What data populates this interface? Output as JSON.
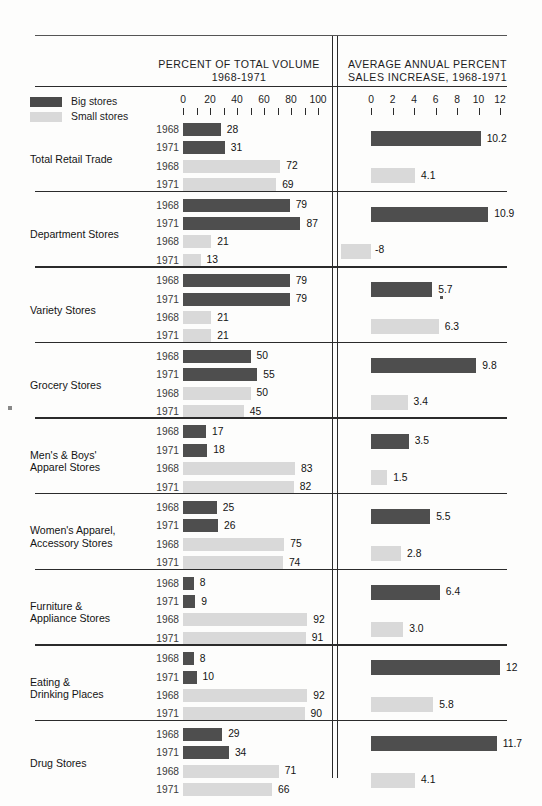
{
  "figure": {
    "left_header": "PERCENT OF TOTAL VOLUME\n1968-1971",
    "left_header_l1": "PERCENT OF TOTAL VOLUME",
    "left_header_l2": "1968-1971",
    "right_header_l1": "AVERAGE ANNUAL PERCENT",
    "right_header_l2": "SALES INCREASE, 1968-1971"
  },
  "legend": {
    "items": [
      {
        "label": "Big stores",
        "color": "#4a4a4a",
        "key": "big"
      },
      {
        "label": "Small stores",
        "color": "#d9d9d9",
        "key": "small"
      }
    ]
  },
  "axes": {
    "left": {
      "labels": [
        "0",
        "20",
        "40",
        "60",
        "80",
        "100"
      ],
      "label_values": [
        0,
        20,
        40,
        60,
        80,
        100
      ],
      "tick_values": [
        0,
        10,
        20,
        30,
        40,
        50,
        60,
        70,
        80,
        90,
        100
      ],
      "min": 0,
      "max": 100
    },
    "right": {
      "labels": [
        "0",
        "2",
        "4",
        "6",
        "8",
        "10",
        "12"
      ],
      "label_values": [
        0,
        2,
        4,
        6,
        8,
        10,
        12
      ],
      "tick_values": [
        0,
        2,
        4,
        6,
        8,
        10,
        12
      ],
      "min": 0,
      "max": 12
    }
  },
  "chart_data": {
    "type": "bar",
    "orientation": "horizontal",
    "grid": false,
    "legend_position": "top-left",
    "panels": [
      {
        "name": "left",
        "title": "PERCENT OF TOTAL VOLUME 1968-1971",
        "xlabel": "",
        "ylabel": "",
        "xlim": [
          0,
          100
        ],
        "xticks": [
          0,
          10,
          20,
          30,
          40,
          50,
          60,
          70,
          80,
          90,
          100
        ],
        "xticklabels": [
          "0",
          "",
          "20",
          "",
          "40",
          "",
          "60",
          "",
          "80",
          "",
          "100"
        ]
      },
      {
        "name": "right",
        "title": "AVERAGE ANNUAL PERCENT SALES INCREASE, 1968-1971",
        "xlabel": "",
        "ylabel": "",
        "xlim": [
          0,
          12
        ],
        "xticks": [
          0,
          2,
          4,
          6,
          8,
          10,
          12
        ],
        "xticklabels": [
          "0",
          "2",
          "4",
          "6",
          "8",
          "10",
          "12"
        ]
      }
    ],
    "categories": [
      "Total Retail Trade",
      "Department Stores",
      "Variety Stores",
      "Grocery Stores",
      "Men's & Boys' Apparel Stores",
      "Women's Apparel, Accessory Stores",
      "Furniture & Appliance Stores",
      "Eating & Drinking Places",
      "Drug Stores"
    ],
    "series": [
      {
        "name": "Big stores, percent of total volume 1968",
        "panel": "left",
        "values": [
          28,
          79,
          79,
          50,
          17,
          25,
          8,
          8,
          29
        ]
      },
      {
        "name": "Big stores, percent of total volume 1971",
        "panel": "left",
        "values": [
          31,
          87,
          79,
          55,
          18,
          26,
          9,
          10,
          34
        ]
      },
      {
        "name": "Small stores, percent of total volume 1968",
        "panel": "left",
        "values": [
          72,
          21,
          21,
          50,
          83,
          75,
          92,
          92,
          71
        ]
      },
      {
        "name": "Small stores, percent of total volume 1971",
        "panel": "left",
        "values": [
          69,
          13,
          21,
          45,
          82,
          74,
          91,
          90,
          66
        ]
      },
      {
        "name": "Big stores, avg annual percent sales increase",
        "panel": "right",
        "values": [
          10.2,
          10.9,
          5.7,
          9.8,
          3.5,
          5.5,
          6.4,
          12,
          11.7
        ]
      },
      {
        "name": "Small stores, avg annual percent sales increase",
        "panel": "right",
        "values": [
          4.1,
          -8,
          6.3,
          3.4,
          1.5,
          2.8,
          3.0,
          5.8,
          4.1
        ]
      }
    ]
  },
  "groups": [
    {
      "id": "total-retail-trade",
      "label": "Total Retail Trade",
      "label_lines": [
        "Total Retail Trade"
      ],
      "left_bars": [
        {
          "year": "1968",
          "kind": "big",
          "value": 28,
          "value_label": "28"
        },
        {
          "year": "1971",
          "kind": "big",
          "value": 31,
          "value_label": "31"
        },
        {
          "year": "1968",
          "kind": "small",
          "value": 72,
          "value_label": "72"
        },
        {
          "year": "1971",
          "kind": "small",
          "value": 69,
          "value_label": "69"
        }
      ],
      "right_bars": [
        {
          "kind": "big",
          "value": 10.2,
          "value_label": "10.2"
        },
        {
          "kind": "small",
          "value": 4.1,
          "value_label": "4.1"
        }
      ]
    },
    {
      "id": "department-stores",
      "label": "Department Stores",
      "label_lines": [
        "Department Stores"
      ],
      "left_bars": [
        {
          "year": "1968",
          "kind": "big",
          "value": 79,
          "value_label": "79"
        },
        {
          "year": "1971",
          "kind": "big",
          "value": 87,
          "value_label": "87"
        },
        {
          "year": "1968",
          "kind": "small",
          "value": 21,
          "value_label": "21"
        },
        {
          "year": "1971",
          "kind": "small",
          "value": 13,
          "value_label": "13"
        }
      ],
      "right_bars": [
        {
          "kind": "big",
          "value": 10.9,
          "value_label": "10.9"
        },
        {
          "kind": "small",
          "value": -8,
          "value_label": "-8",
          "negative": true
        }
      ]
    },
    {
      "id": "variety-stores",
      "label": "Variety Stores",
      "label_lines": [
        "Variety Stores"
      ],
      "left_bars": [
        {
          "year": "1968",
          "kind": "big",
          "value": 79,
          "value_label": "79"
        },
        {
          "year": "1971",
          "kind": "big",
          "value": 79,
          "value_label": "79"
        },
        {
          "year": "1968",
          "kind": "small",
          "value": 21,
          "value_label": "21"
        },
        {
          "year": "1971",
          "kind": "small",
          "value": 21,
          "value_label": "21"
        }
      ],
      "right_bars": [
        {
          "kind": "big",
          "value": 5.7,
          "value_label": "5.7"
        },
        {
          "kind": "small",
          "value": 6.3,
          "value_label": "6.3"
        }
      ]
    },
    {
      "id": "grocery-stores",
      "label": "Grocery Stores",
      "label_lines": [
        "Grocery Stores"
      ],
      "left_bars": [
        {
          "year": "1968",
          "kind": "big",
          "value": 50,
          "value_label": "50"
        },
        {
          "year": "1971",
          "kind": "big",
          "value": 55,
          "value_label": "55"
        },
        {
          "year": "1968",
          "kind": "small",
          "value": 50,
          "value_label": "50"
        },
        {
          "year": "1971",
          "kind": "small",
          "value": 45,
          "value_label": "45"
        }
      ],
      "right_bars": [
        {
          "kind": "big",
          "value": 9.8,
          "value_label": "9.8"
        },
        {
          "kind": "small",
          "value": 3.4,
          "value_label": "3.4"
        }
      ]
    },
    {
      "id": "mens-boys-apparel-stores",
      "label": "Men's & Boys' Apparel Stores",
      "label_lines": [
        "Men's & Boys'",
        "Apparel Stores"
      ],
      "left_bars": [
        {
          "year": "1968",
          "kind": "big",
          "value": 17,
          "value_label": "17"
        },
        {
          "year": "1971",
          "kind": "big",
          "value": 18,
          "value_label": "18"
        },
        {
          "year": "1968",
          "kind": "small",
          "value": 83,
          "value_label": "83"
        },
        {
          "year": "1971",
          "kind": "small",
          "value": 82,
          "value_label": "82"
        }
      ],
      "right_bars": [
        {
          "kind": "big",
          "value": 3.5,
          "value_label": "3.5"
        },
        {
          "kind": "small",
          "value": 1.5,
          "value_label": "1.5"
        }
      ]
    },
    {
      "id": "womens-apparel-accessory-stores",
      "label": "Women's Apparel, Accessory Stores",
      "label_lines": [
        "Women's Apparel,",
        "Accessory Stores"
      ],
      "left_bars": [
        {
          "year": "1968",
          "kind": "big",
          "value": 25,
          "value_label": "25"
        },
        {
          "year": "1971",
          "kind": "big",
          "value": 26,
          "value_label": "26"
        },
        {
          "year": "1968",
          "kind": "small",
          "value": 75,
          "value_label": "75"
        },
        {
          "year": "1971",
          "kind": "small",
          "value": 74,
          "value_label": "74"
        }
      ],
      "right_bars": [
        {
          "kind": "big",
          "value": 5.5,
          "value_label": "5.5"
        },
        {
          "kind": "small",
          "value": 2.8,
          "value_label": "2.8"
        }
      ]
    },
    {
      "id": "furniture-appliance-stores",
      "label": "Furniture & Appliance Stores",
      "label_lines": [
        "Furniture &",
        "Appliance Stores"
      ],
      "left_bars": [
        {
          "year": "1968",
          "kind": "big",
          "value": 8,
          "value_label": "8"
        },
        {
          "year": "1971",
          "kind": "big",
          "value": 9,
          "value_label": "9"
        },
        {
          "year": "1968",
          "kind": "small",
          "value": 92,
          "value_label": "92"
        },
        {
          "year": "1971",
          "kind": "small",
          "value": 91,
          "value_label": "91"
        }
      ],
      "right_bars": [
        {
          "kind": "big",
          "value": 6.4,
          "value_label": "6.4"
        },
        {
          "kind": "small",
          "value": 3.0,
          "value_label": "3.0"
        }
      ]
    },
    {
      "id": "eating-drinking-places",
      "label": "Eating & Drinking Places",
      "label_lines": [
        "Eating &",
        "Drinking Places"
      ],
      "left_bars": [
        {
          "year": "1968",
          "kind": "big",
          "value": 8,
          "value_label": "8"
        },
        {
          "year": "1971",
          "kind": "big",
          "value": 10,
          "value_label": "10"
        },
        {
          "year": "1968",
          "kind": "small",
          "value": 92,
          "value_label": "92"
        },
        {
          "year": "1971",
          "kind": "small",
          "value": 90,
          "value_label": "90"
        }
      ],
      "right_bars": [
        {
          "kind": "big",
          "value": 12,
          "value_label": "12"
        },
        {
          "kind": "small",
          "value": 5.8,
          "value_label": "5.8"
        }
      ]
    },
    {
      "id": "drug-stores",
      "label": "Drug Stores",
      "label_lines": [
        "Drug Stores"
      ],
      "left_bars": [
        {
          "year": "1968",
          "kind": "big",
          "value": 29,
          "value_label": "29"
        },
        {
          "year": "1971",
          "kind": "big",
          "value": 34,
          "value_label": "34"
        },
        {
          "year": "1968",
          "kind": "small",
          "value": 71,
          "value_label": "71"
        },
        {
          "year": "1971",
          "kind": "small",
          "value": 66,
          "value_label": "66"
        }
      ],
      "right_bars": [
        {
          "kind": "big",
          "value": 11.7,
          "value_label": "11.7"
        },
        {
          "kind": "small",
          "value": 4.1,
          "value_label": "4.1"
        }
      ]
    }
  ],
  "colors": {
    "big": "#4e4e4e",
    "small": "#d9d9d9",
    "rule": "#2b2b2b",
    "text": "#141414",
    "background": "#fdfdfc"
  }
}
